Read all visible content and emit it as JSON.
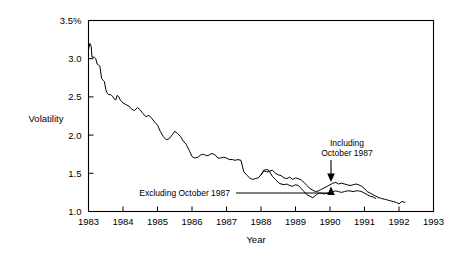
{
  "chart_data": {
    "type": "line",
    "title": "",
    "xlabel": "Year",
    "ylabel": "Volatility",
    "xlim": [
      1983,
      1993
    ],
    "ylim": [
      1.0,
      3.5
    ],
    "grid": false,
    "legend_position": "inline-annotations",
    "y_ticks": [
      "3.5%",
      "3.0",
      "2.5",
      "2.0",
      "1.5",
      "1.0"
    ],
    "y_tick_values": [
      3.5,
      3.0,
      2.5,
      2.0,
      1.5,
      1.0
    ],
    "x_ticks": [
      "1983",
      "1984",
      "1985",
      "1986",
      "1987",
      "1988",
      "1989",
      "1990",
      "1991",
      "1992",
      "1993"
    ],
    "x_tick_values": [
      1983,
      1984,
      1985,
      1986,
      1987,
      1988,
      1989,
      1990,
      1991,
      1992,
      1993
    ],
    "annotations": [
      {
        "name": "including-october-1987",
        "text_line1": "Including",
        "text_line2": "October 1987",
        "points_to_x": 1990.1,
        "points_to_y": 1.38,
        "direction": "down"
      },
      {
        "name": "excluding-october-1987",
        "text_line1": "Excluding October 1987",
        "points_to_x": 1990.1,
        "points_to_y": 1.26,
        "direction": "up"
      }
    ],
    "series": [
      {
        "name": "Including October 1987",
        "color": "#000000",
        "x": [
          1983.0,
          1983.04,
          1983.08,
          1983.1,
          1983.13,
          1983.17,
          1983.21,
          1983.25,
          1983.29,
          1983.33,
          1983.38,
          1983.42,
          1983.46,
          1983.5,
          1983.54,
          1983.58,
          1983.63,
          1983.67,
          1983.71,
          1983.75,
          1983.79,
          1983.83,
          1983.88,
          1983.92,
          1983.96,
          1984.0,
          1984.08,
          1984.17,
          1984.25,
          1984.33,
          1984.42,
          1984.5,
          1984.58,
          1984.67,
          1984.75,
          1984.83,
          1984.92,
          1985.0,
          1985.08,
          1985.17,
          1985.25,
          1985.33,
          1985.42,
          1985.5,
          1985.58,
          1985.67,
          1985.75,
          1985.83,
          1985.92,
          1986.0,
          1986.08,
          1986.17,
          1986.25,
          1986.33,
          1986.42,
          1986.5,
          1986.58,
          1986.67,
          1986.75,
          1986.83,
          1986.92,
          1987.0,
          1987.08,
          1987.17,
          1987.25,
          1987.33,
          1987.42,
          1987.5,
          1987.58,
          1987.67,
          1987.75,
          1987.83,
          1987.92,
          1988.0,
          1988.08,
          1988.17,
          1988.25,
          1988.33,
          1988.42,
          1988.5,
          1988.58,
          1988.67,
          1988.75,
          1988.83,
          1988.92,
          1989.0,
          1989.08,
          1989.17,
          1989.25,
          1989.33,
          1989.42,
          1989.5,
          1989.58,
          1989.67,
          1989.75,
          1989.83,
          1989.92,
          1990.0,
          1990.08,
          1990.17,
          1990.25,
          1990.33,
          1990.42,
          1990.5,
          1990.58,
          1990.67,
          1990.75,
          1990.83,
          1990.92,
          1991.0,
          1991.08,
          1991.17,
          1991.25,
          1991.33,
          1991.42,
          1991.5,
          1991.58,
          1991.67,
          1991.75,
          1991.83,
          1991.92,
          1992.0,
          1992.08,
          1992.17
        ],
        "y": [
          3.12,
          3.2,
          3.16,
          3.02,
          3.02,
          3.02,
          3.0,
          2.93,
          2.92,
          2.9,
          2.74,
          2.72,
          2.7,
          2.6,
          2.55,
          2.53,
          2.53,
          2.52,
          2.5,
          2.47,
          2.46,
          2.52,
          2.5,
          2.46,
          2.44,
          2.42,
          2.4,
          2.38,
          2.34,
          2.32,
          2.36,
          2.33,
          2.28,
          2.24,
          2.26,
          2.22,
          2.17,
          2.13,
          2.05,
          1.98,
          1.94,
          1.95,
          2.0,
          2.05,
          2.02,
          1.98,
          1.92,
          1.88,
          1.8,
          1.72,
          1.7,
          1.71,
          1.74,
          1.75,
          1.73,
          1.74,
          1.76,
          1.74,
          1.7,
          1.7,
          1.71,
          1.7,
          1.68,
          1.68,
          1.67,
          1.68,
          1.67,
          1.52,
          1.48,
          1.44,
          1.42,
          1.43,
          1.44,
          1.48,
          1.54,
          1.55,
          1.53,
          1.54,
          1.5,
          1.48,
          1.47,
          1.44,
          1.43,
          1.45,
          1.42,
          1.44,
          1.43,
          1.41,
          1.38,
          1.34,
          1.3,
          1.28,
          1.26,
          1.27,
          1.29,
          1.31,
          1.33,
          1.35,
          1.37,
          1.38,
          1.36,
          1.37,
          1.36,
          1.35,
          1.34,
          1.35,
          1.36,
          1.35,
          1.33,
          1.3,
          1.26,
          1.24,
          1.22,
          1.2,
          1.18,
          1.17,
          1.16,
          1.15,
          1.14,
          1.13,
          1.12,
          1.1,
          1.13,
          1.12
        ]
      },
      {
        "name": "Excluding October 1987",
        "color": "#000000",
        "x": [
          1988.0,
          1988.08,
          1988.17,
          1988.25,
          1988.33,
          1988.42,
          1988.5,
          1988.58,
          1988.67,
          1988.75,
          1988.83,
          1988.92,
          1989.0,
          1989.08,
          1989.17,
          1989.25,
          1989.33,
          1989.42,
          1989.5,
          1989.58,
          1989.67,
          1989.75,
          1989.83,
          1989.92,
          1990.0,
          1990.08,
          1990.17,
          1990.25,
          1990.33,
          1990.42,
          1990.5,
          1990.58,
          1990.67,
          1990.75,
          1990.83,
          1990.92,
          1991.0,
          1991.08,
          1991.17,
          1991.25,
          1991.33
        ],
        "y": [
          1.48,
          1.53,
          1.52,
          1.52,
          1.46,
          1.42,
          1.38,
          1.36,
          1.35,
          1.36,
          1.34,
          1.33,
          1.35,
          1.34,
          1.3,
          1.26,
          1.22,
          1.2,
          1.18,
          1.21,
          1.24,
          1.24,
          1.23,
          1.24,
          1.25,
          1.26,
          1.27,
          1.26,
          1.25,
          1.26,
          1.27,
          1.27,
          1.26,
          1.27,
          1.27,
          1.26,
          1.24,
          1.22,
          1.2,
          1.19,
          1.17
        ]
      }
    ]
  }
}
